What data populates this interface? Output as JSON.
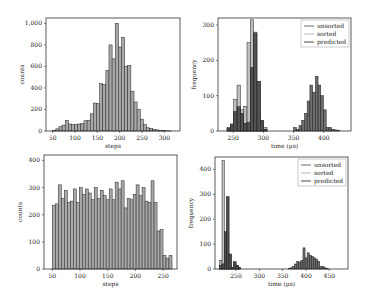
{
  "chart_data": [
    {
      "id": "top-left",
      "type": "bar",
      "title": "",
      "xlabel": "steps",
      "ylabel": "counts",
      "xlim": [
        35,
        335
      ],
      "ylim": [
        0,
        1050
      ],
      "xticks": [
        50,
        100,
        150,
        200,
        250,
        300
      ],
      "yticks": [
        0,
        200,
        400,
        600,
        800,
        1000
      ],
      "ytick_labels": [
        "0",
        "200",
        "400",
        "600",
        "800",
        "1,000"
      ],
      "bin_width": 7,
      "bin_start": 50,
      "values": [
        5,
        20,
        40,
        55,
        100,
        65,
        60,
        60,
        65,
        70,
        95,
        100,
        160,
        260,
        255,
        440,
        430,
        560,
        800,
        670,
        1000,
        780,
        870,
        600,
        610,
        370,
        270,
        200,
        110,
        60,
        30,
        25,
        15,
        10,
        5,
        3,
        2,
        1
      ],
      "grid": false,
      "legend": null,
      "bar_color": "#a8a8a8"
    },
    {
      "id": "top-right",
      "type": "bar",
      "title": "",
      "xlabel": "time (μs)",
      "ylabel": "frequency",
      "xlim": [
        225,
        445
      ],
      "ylim": [
        0,
        320
      ],
      "xticks": [
        250,
        300,
        350,
        400
      ],
      "yticks": [
        0,
        100,
        200,
        300
      ],
      "legend": {
        "position": "upper right",
        "entries": [
          "unsorted",
          "sorted",
          "predicted"
        ]
      },
      "series": [
        {
          "name": "sorted",
          "color": "#b8b8b8",
          "bin_start": 240,
          "bin_width": 5.5,
          "values": [
            5,
            20,
            90,
            130,
            60,
            70,
            250,
            315,
            110,
            50,
            20,
            10
          ]
        },
        {
          "name": "unsorted",
          "color": "#6a6a6a",
          "bin_start": 240,
          "bin_width": 5.5,
          "values": [
            10,
            15,
            50,
            70,
            50,
            20,
            20,
            175,
            280,
            140,
            30,
            5
          ]
        },
        {
          "name": "predicted",
          "color": "#4a4a4a",
          "bin_start": 240,
          "bin_width": 5.5,
          "values": [
            8,
            18,
            55,
            65,
            48,
            22,
            25,
            180,
            275,
            140,
            30,
            5
          ]
        },
        {
          "name": "predicted-cluster2",
          "color": "#555555",
          "bin_start": 350,
          "bin_width": 4.5,
          "values": [
            10,
            5,
            15,
            30,
            50,
            85,
            130,
            110,
            155,
            130,
            100,
            60,
            10,
            10,
            5,
            3,
            2
          ]
        }
      ],
      "grid": false
    },
    {
      "id": "bottom-left",
      "type": "bar",
      "title": "",
      "xlabel": "steps",
      "ylabel": "counts",
      "xlim": [
        35,
        275
      ],
      "ylim": [
        0,
        420
      ],
      "xticks": [
        50,
        100,
        150,
        200,
        250
      ],
      "yticks": [
        0,
        100,
        200,
        300,
        400
      ],
      "bin_start": 50,
      "bin_width": 5.4,
      "values": [
        235,
        240,
        310,
        260,
        290,
        245,
        250,
        295,
        245,
        300,
        275,
        295,
        280,
        255,
        300,
        260,
        290,
        270,
        255,
        295,
        255,
        320,
        295,
        325,
        225,
        260,
        255,
        275,
        310,
        270,
        300,
        250,
        245,
        325,
        245,
        140,
        145,
        50,
        40,
        50
      ],
      "grid": false,
      "legend": null,
      "bar_color": "#a8a8a8"
    },
    {
      "id": "bottom-right",
      "type": "bar",
      "title": "",
      "xlabel": "time (μs)",
      "ylabel": "frequency",
      "xlim": [
        205,
        490
      ],
      "ylim": [
        0,
        450
      ],
      "xticks": [
        250,
        300,
        350,
        400,
        450
      ],
      "yticks": [
        0,
        100,
        200,
        300,
        400
      ],
      "legend": {
        "position": "upper right",
        "entries": [
          "unsorted",
          "sorted",
          "predicted"
        ]
      },
      "series": [
        {
          "name": "sorted",
          "color": "#b8b8b8",
          "bin_start": 215,
          "bin_width": 5,
          "values": [
            35,
            435,
            20,
            5,
            5,
            5,
            30,
            10,
            5
          ]
        },
        {
          "name": "unsorted",
          "color": "#6a6a6a",
          "bin_start": 215,
          "bin_width": 5,
          "values": [
            15,
            20,
            145,
            290,
            60,
            5,
            25,
            15,
            5
          ]
        },
        {
          "name": "predicted",
          "color": "#4a4a4a",
          "bin_start": 215,
          "bin_width": 5,
          "values": [
            15,
            20,
            150,
            290,
            60,
            5,
            25,
            15,
            5
          ]
        },
        {
          "name": "predicted-cluster2",
          "color": "#555555",
          "bin_start": 362,
          "bin_width": 4.5,
          "values": [
            3,
            5,
            10,
            20,
            30,
            28,
            35,
            85,
            45,
            65,
            55,
            50,
            45,
            40,
            30,
            10,
            10,
            5,
            3
          ]
        }
      ],
      "grid": false
    }
  ]
}
